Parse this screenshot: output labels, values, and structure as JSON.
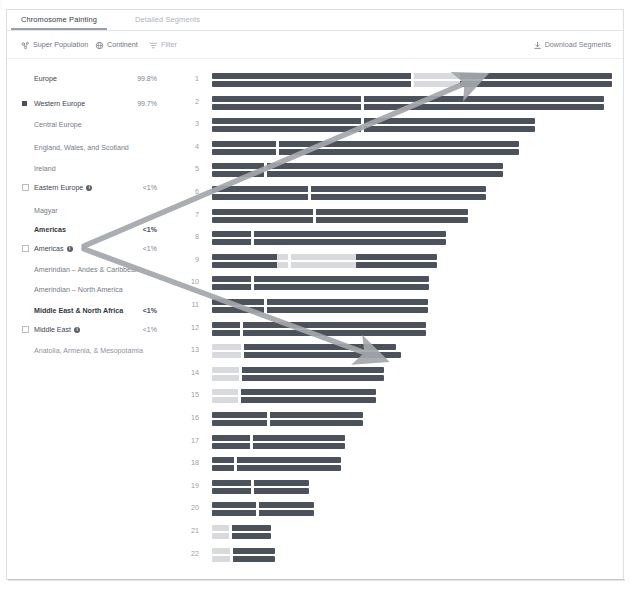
{
  "tabs": [
    {
      "label": "Chromosome Painting",
      "active": true
    },
    {
      "label": "Detailed Segments",
      "active": false
    }
  ],
  "toolbar": {
    "super_population": "Super Population",
    "continent": "Continent",
    "filter": "Filter",
    "download": "Download Segments"
  },
  "legend": {
    "items": [
      {
        "label": "Europe",
        "pct": "99.8%",
        "bullet": "none",
        "style": "plain",
        "info": false
      },
      {
        "label": "Western Europe",
        "pct": "99.7%",
        "bullet": "filled",
        "style": "plain",
        "info": false
      },
      {
        "label": "Central Europe",
        "pct": "",
        "bullet": "none",
        "style": "sub",
        "info": false
      },
      {
        "label": "England, Wales, and Scotland",
        "pct": "",
        "bullet": "none",
        "style": "sub",
        "info": false
      },
      {
        "label": "Ireland",
        "pct": "",
        "bullet": "none",
        "style": "sub",
        "info": false
      },
      {
        "label": "Eastern Europe",
        "pct": "<1%",
        "bullet": "hollow",
        "style": "plain",
        "info": true
      },
      {
        "label": "Magyar",
        "pct": "",
        "bullet": "none",
        "style": "sub",
        "info": false
      },
      {
        "label": "Americas",
        "pct": "<1%",
        "bullet": "none",
        "style": "bold",
        "info": false
      },
      {
        "label": "Americas",
        "pct": "<1%",
        "bullet": "hollow",
        "style": "plain",
        "info": true
      },
      {
        "label": "Amerindian – Andes & Caribbean",
        "pct": "",
        "bullet": "none",
        "style": "sub",
        "info": false
      },
      {
        "label": "Amerindian – North America",
        "pct": "",
        "bullet": "none",
        "style": "sub",
        "info": false
      },
      {
        "label": "Middle East & North Africa",
        "pct": "<1%",
        "bullet": "none",
        "style": "bold",
        "info": false
      },
      {
        "label": "Middle East",
        "pct": "<1%",
        "bullet": "hollow",
        "style": "plain",
        "info": true
      },
      {
        "label": "Anatolia, Armenia, & Mesopotamia",
        "pct": "",
        "bullet": "none",
        "style": "faint",
        "info": false
      }
    ]
  },
  "chart_data": {
    "type": "chromosome-painting",
    "title": "Chromosome Painting",
    "colors": {
      "ancestry_main": "#4c525c",
      "ancestry_light": "#d8dade",
      "ancestry_pale": "#e7e9eb",
      "ancestry_mid": "#c9ccd1",
      "background": "#ffffff",
      "annotation_arrow": "#a3a7ab"
    },
    "chromosomes": [
      {
        "num": "1",
        "len": 391,
        "cent": 0.5,
        "segments": [
          [
            0.0,
            0.5,
            "main"
          ],
          [
            0.5,
            0.62,
            "light"
          ],
          [
            0.62,
            1.0,
            "main"
          ]
        ]
      },
      {
        "num": "2",
        "len": 383,
        "cent": 0.385,
        "segments": [
          [
            0.0,
            1.0,
            "main"
          ]
        ]
      },
      {
        "num": "3",
        "len": 316,
        "cent": 0.465,
        "segments": [
          [
            0.0,
            1.0,
            "main"
          ]
        ]
      },
      {
        "num": "4",
        "len": 300,
        "cent": 0.215,
        "segments": [
          [
            0.0,
            1.0,
            "main"
          ]
        ]
      },
      {
        "num": "5",
        "len": 284,
        "cent": 0.185,
        "segments": [
          [
            0.0,
            1.0,
            "main"
          ]
        ]
      },
      {
        "num": "6",
        "len": 268,
        "cent": 0.355,
        "segments": [
          [
            0.0,
            1.0,
            "main"
          ]
        ]
      },
      {
        "num": "7",
        "len": 250,
        "cent": 0.4,
        "segments": [
          [
            0.0,
            1.0,
            "main"
          ]
        ]
      },
      {
        "num": "8",
        "len": 229,
        "cent": 0.175,
        "segments": [
          [
            0.0,
            1.0,
            "main"
          ]
        ]
      },
      {
        "num": "9",
        "len": 220,
        "cent": 0.345,
        "segments": [
          [
            0.0,
            0.29,
            "main"
          ],
          [
            0.29,
            0.64,
            "light"
          ],
          [
            0.64,
            1.0,
            "main"
          ]
        ]
      },
      {
        "num": "10",
        "len": 212,
        "cent": 0.185,
        "segments": [
          [
            0.0,
            1.0,
            "main"
          ]
        ]
      },
      {
        "num": "11",
        "len": 211,
        "cent": 0.25,
        "segments": [
          [
            0.0,
            1.0,
            "main"
          ]
        ]
      },
      {
        "num": "12",
        "len": 209,
        "cent": 0.14,
        "segments": [
          [
            0.0,
            1.0,
            "main"
          ]
        ]
      },
      {
        "num": "13",
        "len": 180,
        "cent": 0.165,
        "segments": [
          [
            0.0,
            0.165,
            "light"
          ],
          [
            0.165,
            1.0,
            "main"
          ]
        ]
      },
      {
        "num": "14",
        "len": 168,
        "cent": 0.165,
        "segments": [
          [
            0.0,
            0.165,
            "light"
          ],
          [
            0.165,
            1.0,
            "main"
          ]
        ]
      },
      {
        "num": "15",
        "len": 160,
        "cent": 0.17,
        "segments": [
          [
            0.0,
            0.17,
            "light"
          ],
          [
            0.17,
            1.0,
            "main"
          ]
        ]
      },
      {
        "num": "16",
        "len": 148,
        "cent": 0.37,
        "segments": [
          [
            0.0,
            1.0,
            "main"
          ]
        ]
      },
      {
        "num": "17",
        "len": 130,
        "cent": 0.3,
        "segments": [
          [
            0.0,
            1.0,
            "main"
          ]
        ]
      },
      {
        "num": "18",
        "len": 126,
        "cent": 0.185,
        "segments": [
          [
            0.0,
            1.0,
            "main"
          ]
        ]
      },
      {
        "num": "19",
        "len": 95,
        "cent": 0.42,
        "segments": [
          [
            0.0,
            1.0,
            "main"
          ]
        ]
      },
      {
        "num": "20",
        "len": 100,
        "cent": 0.44,
        "segments": [
          [
            0.0,
            1.0,
            "main"
          ]
        ]
      },
      {
        "num": "21",
        "len": 58,
        "cent": 0.31,
        "segments": [
          [
            0.0,
            0.31,
            "light"
          ],
          [
            0.31,
            1.0,
            "main"
          ]
        ]
      },
      {
        "num": "22",
        "len": 62,
        "cent": 0.3,
        "segments": [
          [
            0.0,
            0.3,
            "light"
          ],
          [
            0.3,
            1.0,
            "main"
          ]
        ]
      }
    ],
    "annotations": [
      {
        "name": "arrow-to-chr1",
        "from": [
          84,
          246
        ],
        "to": [
          468,
          82
        ]
      },
      {
        "name": "arrow-to-chr13",
        "from": [
          84,
          249
        ],
        "to": [
          368,
          354
        ]
      }
    ]
  }
}
